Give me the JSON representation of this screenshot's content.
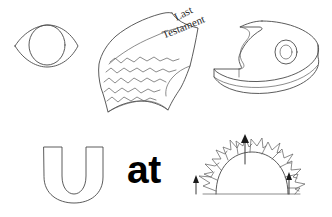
{
  "canvas": {
    "width": 332,
    "height": 217,
    "background": "#ffffff",
    "stroke_color": "#4a4a4a",
    "text_color": "#000000"
  },
  "drawing": {
    "title": "hand-drawn rebus puzzle sketch",
    "style": "line-art sketch, thin gray pen outlines on white"
  },
  "objects": [
    {
      "id": "eye",
      "data_name": "eye-drawing",
      "label": "eye",
      "description": "almond lens outline with circular iris inside",
      "position": {
        "x": 14,
        "y": 26,
        "width": 64,
        "height": 40
      }
    },
    {
      "id": "scroll",
      "data_name": "scroll-drawing",
      "label": "scroll",
      "description": "curled parchment sheet with squiggly writing lines",
      "position": {
        "x": 97,
        "y": 12,
        "width": 105,
        "height": 102
      },
      "text_lines": [
        "Last",
        "Testament"
      ],
      "text_rotation_deg": -27,
      "squiggle_rows": 5
    },
    {
      "id": "letter-e-3d",
      "data_name": "letter-e-3d-drawing",
      "label": "3D letter e",
      "description": "extruded rounded e / palette slab with a small oval hole",
      "position": {
        "x": 216,
        "y": 20,
        "width": 104,
        "height": 76
      },
      "hole": {
        "cx": 286,
        "cy": 52,
        "rx": 9,
        "ry": 11
      }
    },
    {
      "id": "letter-u",
      "data_name": "letter-u-drawing",
      "label": "letter U",
      "description": "outlined capital U",
      "position": {
        "x": 42,
        "y": 146,
        "width": 62,
        "height": 56
      }
    },
    {
      "id": "word-at",
      "data_name": "word-at-text",
      "label": "at",
      "text": "at",
      "font_weight": "bold",
      "font_size_px": 39,
      "position": {
        "x": 127,
        "y": 150,
        "width": 56,
        "height": 42
      }
    },
    {
      "id": "rising-sun",
      "data_name": "rising-sun-drawing",
      "label": "rising sun",
      "description": "half dome with zigzag flame rays sitting on a horizontal ground line, three upward arrows",
      "position": {
        "x": 196,
        "y": 134,
        "width": 124,
        "height": 66
      },
      "ray_count": 12,
      "arrows": [
        {
          "name": "arrow-up-center",
          "x": 245,
          "y_top": 137,
          "y_bottom": 164,
          "length": 27
        },
        {
          "name": "arrow-up-left",
          "x": 196,
          "y_top": 176,
          "y_bottom": 194,
          "length": 18
        },
        {
          "name": "arrow-up-right",
          "x": 289,
          "y_top": 172,
          "y_bottom": 194,
          "length": 22
        }
      ],
      "ground_line": {
        "x1": 203,
        "x2": 300,
        "y": 194
      }
    }
  ]
}
